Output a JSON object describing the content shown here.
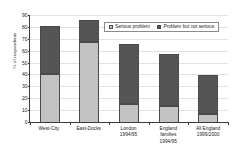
{
  "chart_data": {
    "type": "bar",
    "subtype": "stacked-vertical",
    "title": "",
    "xlabel": "",
    "ylabel": "% of respondents",
    "ylim": [
      0,
      90
    ],
    "ytick_step": 10,
    "yticks": [
      0,
      10,
      20,
      30,
      40,
      50,
      60,
      70,
      80,
      90
    ],
    "ytick_labels": [
      "0",
      "10",
      "20",
      "30",
      "40",
      "50",
      "60",
      "70",
      "80",
      "90"
    ],
    "grid": true,
    "grid_axis": "y",
    "legend_position": "upper-center",
    "categories": [
      "West-City",
      "East-Docks",
      "London 1994/95",
      "England families 1994/95",
      "All England 1999/2000"
    ],
    "category_lines": [
      [
        "West-City"
      ],
      [
        "East-Docks"
      ],
      [
        "London",
        "1994/95"
      ],
      [
        "England",
        "families",
        "1994/95"
      ],
      [
        "All England",
        "1999/2000"
      ]
    ],
    "series": [
      {
        "name": "Serious problem",
        "color": "#c2c2c2",
        "values": [
          40,
          67,
          15,
          13,
          7
        ]
      },
      {
        "name": "Problem but not serious",
        "color": "#555555",
        "values": [
          40,
          18,
          50,
          44,
          32
        ]
      }
    ],
    "totals": [
      80,
      85,
      65,
      57,
      39
    ]
  },
  "colors": {
    "serious_problem": "#c2c2c2",
    "problem_not_serious": "#555555",
    "axis": "#3c3c3c",
    "grid": "#e2e2e2",
    "bar_outline": "#4a4a4a",
    "legend_border": "#8a8a8a",
    "background": "#ffffff"
  }
}
